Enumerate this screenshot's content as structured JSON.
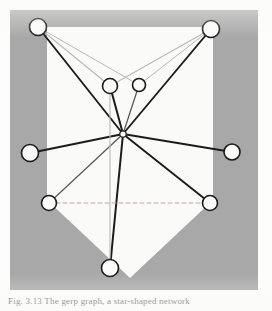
{
  "figure": {
    "domain_kind": "diagram",
    "caption": "Fig. 3.13  The gerp graph, a star-shaped network",
    "colors": {
      "page_background": "#fdfdfc",
      "plate_background": "#a8a8a8",
      "polygon_fill": "#fafaf8",
      "edge_dark": "#1c1c1c",
      "edge_medium": "#5a5a5a",
      "edge_light": "#b9b9b9",
      "dashed_edge": "#c9a3a3",
      "node_fill": "#fbfbf9",
      "node_stroke": "#1a1a1a"
    },
    "plate": {
      "x": 10,
      "y": 10,
      "width": 248,
      "height": 280
    },
    "polygon_points": "47,27 213,27 213,200 130,278 47,200",
    "nodes": [
      {
        "id": "n-top-left",
        "label": "top-left vertex",
        "cx": 38,
        "cy": 27,
        "r": 8.5
      },
      {
        "id": "n-top-right",
        "label": "top-right vertex",
        "cx": 211,
        "cy": 29,
        "r": 8.5
      },
      {
        "id": "n-upper-mid-l",
        "label": "upper-middle-left vertex",
        "cx": 110,
        "cy": 86,
        "r": 7.5
      },
      {
        "id": "n-upper-mid-r",
        "label": "upper-middle-right vertex",
        "cx": 139,
        "cy": 85,
        "r": 6.5
      },
      {
        "id": "n-center",
        "label": "central hub vertex",
        "cx": 123,
        "cy": 134,
        "r": 3.2
      },
      {
        "id": "n-left",
        "label": "left vertex",
        "cx": 30,
        "cy": 153,
        "r": 8.5
      },
      {
        "id": "n-right",
        "label": "right vertex",
        "cx": 232,
        "cy": 152,
        "r": 8.0
      },
      {
        "id": "n-bottom-left",
        "label": "bottom-left vertex",
        "cx": 49,
        "cy": 203,
        "r": 7.5
      },
      {
        "id": "n-bottom-right",
        "label": "bottom-right vertex",
        "cx": 210,
        "cy": 203,
        "r": 7.5
      },
      {
        "id": "n-bottom",
        "label": "bottom vertex",
        "cx": 110,
        "cy": 268,
        "r": 8.5
      }
    ],
    "edges": [
      {
        "id": "e-tl-center",
        "from": "n-top-left",
        "to": "n-center",
        "weight": "dark",
        "width": 1.9,
        "style": "solid"
      },
      {
        "id": "e-tl-uml",
        "from": "n-top-left",
        "to": "n-upper-mid-l",
        "weight": "light",
        "width": 1.1,
        "style": "solid"
      },
      {
        "id": "e-tl-umr",
        "from": "n-top-left",
        "to": "n-upper-mid-r",
        "weight": "light",
        "width": 1.0,
        "style": "solid"
      },
      {
        "id": "e-tr-center",
        "from": "n-top-right",
        "to": "n-center",
        "weight": "dark",
        "width": 1.9,
        "style": "solid"
      },
      {
        "id": "e-tr-uml",
        "from": "n-top-right",
        "to": "n-upper-mid-l",
        "weight": "light",
        "width": 1.1,
        "style": "solid"
      },
      {
        "id": "e-tr-umr",
        "from": "n-top-right",
        "to": "n-upper-mid-r",
        "weight": "light",
        "width": 1.0,
        "style": "solid"
      },
      {
        "id": "e-uml-center",
        "from": "n-upper-mid-l",
        "to": "n-center",
        "weight": "dark",
        "width": 2.0,
        "style": "solid"
      },
      {
        "id": "e-umr-center",
        "from": "n-upper-mid-r",
        "to": "n-center",
        "weight": "medium",
        "width": 1.3,
        "style": "solid"
      },
      {
        "id": "e-left-center",
        "from": "n-left",
        "to": "n-center",
        "weight": "dark",
        "width": 2.2,
        "style": "solid"
      },
      {
        "id": "e-right-center",
        "from": "n-right",
        "to": "n-center",
        "weight": "dark",
        "width": 1.9,
        "style": "solid"
      },
      {
        "id": "e-bl-center",
        "from": "n-bottom-left",
        "to": "n-center",
        "weight": "medium",
        "width": 1.3,
        "style": "solid"
      },
      {
        "id": "e-br-center",
        "from": "n-bottom-right",
        "to": "n-center",
        "weight": "dark",
        "width": 1.9,
        "style": "solid"
      },
      {
        "id": "e-bottom-center",
        "from": "n-bottom",
        "to": "n-center",
        "weight": "dark",
        "width": 2.0,
        "style": "solid"
      },
      {
        "id": "e-uml-bottom",
        "from": "n-upper-mid-l",
        "to": "n-bottom",
        "weight": "light",
        "width": 1.1,
        "style": "solid"
      },
      {
        "id": "e-bl-br",
        "from": "n-bottom-left",
        "to": "n-bottom-right",
        "weight": "dashed",
        "width": 1.0,
        "style": "dashed"
      }
    ]
  }
}
